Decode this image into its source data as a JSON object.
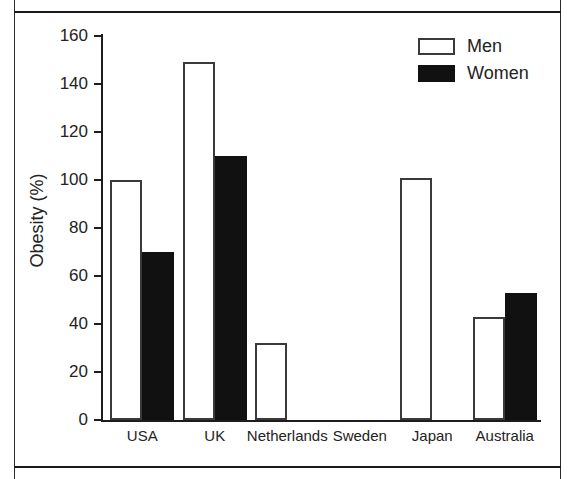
{
  "figure": {
    "frame_color": "#1a1a1a",
    "background": "#ffffff"
  },
  "legend": {
    "position": "top-right",
    "entries": [
      {
        "label": "Men",
        "swatch": "open-white-rectangle",
        "color": "#ffffff"
      },
      {
        "label": "Women",
        "swatch": "filled-black-rectangle",
        "color": "#111111"
      }
    ]
  },
  "axes": {
    "y": {
      "title": "Obesity (%)",
      "ticks": [
        "160",
        "140",
        "120",
        "100",
        "80",
        "60",
        "40",
        "20",
        "0"
      ]
    },
    "x": {
      "title": "",
      "ticks": [
        "USA",
        "UK",
        "Netherlands",
        "Sweden",
        "Japan",
        "Australia"
      ]
    }
  },
  "chart_data": {
    "type": "bar",
    "title": "",
    "xlabel": "",
    "ylabel": "Obesity (%)",
    "ylim": [
      0,
      160
    ],
    "ytick_step": 20,
    "grid": false,
    "legend_position": "top right",
    "categories": [
      "USA",
      "UK",
      "Netherlands",
      "Sweden",
      "Japan",
      "Australia"
    ],
    "series": [
      {
        "name": "Men",
        "color": "#ffffff",
        "values": [
          100,
          149,
          32,
          0,
          101,
          43
        ]
      },
      {
        "name": "Women",
        "color": "#111111",
        "values": [
          70,
          110,
          0,
          0,
          0,
          53
        ]
      }
    ]
  }
}
